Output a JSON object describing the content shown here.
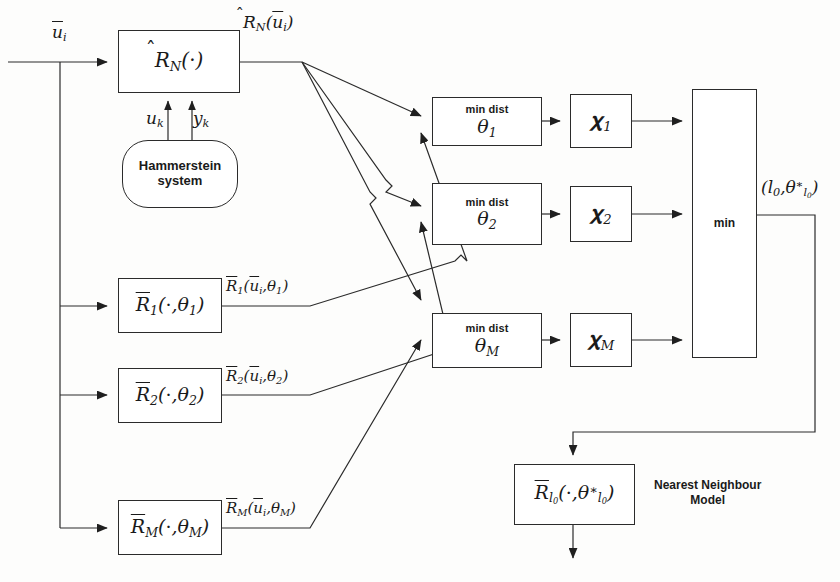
{
  "diagram": {
    "line_color": "#2b2b2b",
    "background": "#fdfdfc"
  },
  "blocks": {
    "estimator": {
      "label": "R̂_N(·)"
    },
    "plant": {
      "label_line1": "Hammerstein",
      "label_line2": "system"
    },
    "model1": {
      "label": "R̄_1(·,θ_1)"
    },
    "model2": {
      "label": "R̄_2(·,θ_2)"
    },
    "modelM": {
      "label": "R̄_M(·,θ_M)"
    },
    "mindist1": {
      "caption": "min dist",
      "label": "θ_1"
    },
    "mindist2": {
      "caption": "min dist",
      "label": "θ_2"
    },
    "mindistM": {
      "caption": "min dist",
      "label": "θ_M"
    },
    "chi1": {
      "label": "χ_1"
    },
    "chi2": {
      "label": "χ_2"
    },
    "chiM": {
      "label": "χ_M"
    },
    "min": {
      "label": "min"
    },
    "nn_model": {
      "label": "R̄_{l0}(·,θ*_{l0})"
    }
  },
  "signals": {
    "input": "ū_i",
    "estimator_output": "R̂_N(ū_i)",
    "uk": "u_k",
    "yk": "y_k",
    "model1_output": "R̄_1(ū_i,θ_1)",
    "model2_output": "R̄_2(ū_i,θ_2)",
    "modelM_output": "R̄_M(ū_i,θ_M)",
    "min_output": "(l_0,θ*_{l0})"
  },
  "annotations": {
    "nearest_neighbour": {
      "line1": "Nearest Neighbour",
      "line2": "Model"
    }
  }
}
